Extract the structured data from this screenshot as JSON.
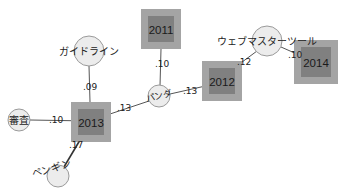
{
  "diagram": {
    "type": "network-graph",
    "colors": {
      "square_outer": "#a4a4a4",
      "square_inner": "#808080",
      "circle_fill": "#ececec",
      "circle_stroke": "#9a9a9a",
      "edge": "#555555",
      "text": "#222222"
    },
    "nodes": [
      {
        "id": "n2011",
        "label": "2011",
        "shape": "square",
        "cx": 161,
        "cy": 29,
        "outer": 40,
        "inner": 26
      },
      {
        "id": "n2012",
        "label": "2012",
        "shape": "square",
        "cx": 222,
        "cy": 81,
        "outer": 40,
        "inner": 26
      },
      {
        "id": "n2013",
        "label": "2013",
        "shape": "square",
        "cx": 91,
        "cy": 122,
        "outer": 40,
        "inner": 26
      },
      {
        "id": "n2014",
        "label": "2014",
        "shape": "square",
        "cx": 316,
        "cy": 62,
        "outer": 44,
        "inner": 30
      },
      {
        "id": "guideline",
        "label": "ガイドライン",
        "shape": "circle",
        "cx": 89,
        "cy": 51,
        "r": 15
      },
      {
        "id": "webmaster",
        "label": "ウェブマスターツール",
        "shape": "circle",
        "cx": 267,
        "cy": 41,
        "r": 15
      },
      {
        "id": "panda",
        "label": "パンダ",
        "shape": "circle",
        "cx": 159,
        "cy": 96,
        "r": 11
      },
      {
        "id": "review",
        "label": "審査",
        "shape": "circle",
        "cx": 19,
        "cy": 120,
        "r": 11
      },
      {
        "id": "penguin",
        "label": "ペンギン",
        "shape": "circle",
        "cx": 58,
        "cy": 176,
        "r": 11
      }
    ],
    "edges": [
      {
        "from": "n2011",
        "to": "panda",
        "weight": ".10"
      },
      {
        "from": "guideline",
        "to": "n2013",
        "weight": ".09"
      },
      {
        "from": "panda",
        "to": "n2013",
        "weight": ".13"
      },
      {
        "from": "panda",
        "to": "n2012",
        "weight": ".13"
      },
      {
        "from": "n2012",
        "to": "webmaster",
        "weight": ".12"
      },
      {
        "from": "webmaster",
        "to": "n2014",
        "weight": ".10"
      },
      {
        "from": "review",
        "to": "n2013",
        "weight": ".10"
      },
      {
        "from": "n2013",
        "to": "penguin",
        "weight": ".17"
      }
    ]
  }
}
